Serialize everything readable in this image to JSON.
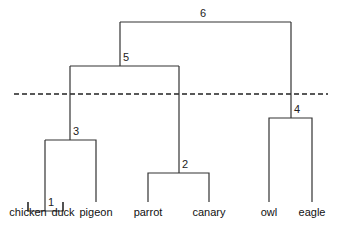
{
  "diagram": {
    "type": "dendrogram",
    "leaves": [
      {
        "label": "chicken",
        "x": 28
      },
      {
        "label": "duck",
        "x": 63
      },
      {
        "label": "pigeon",
        "x": 96
      },
      {
        "label": "parrot",
        "x": 148
      },
      {
        "label": "canary",
        "x": 209
      },
      {
        "label": "owl",
        "x": 269
      },
      {
        "label": "eagle",
        "x": 312
      }
    ],
    "nodes": [
      {
        "id": "1",
        "label": "1",
        "children": [
          "chicken",
          "duck"
        ]
      },
      {
        "id": "2",
        "label": "2",
        "children": [
          "parrot",
          "canary"
        ]
      },
      {
        "id": "3",
        "label": "3",
        "children": [
          "1",
          "pigeon"
        ]
      },
      {
        "id": "4",
        "label": "4",
        "children": [
          "owl",
          "eagle"
        ]
      },
      {
        "id": "5",
        "label": "5",
        "children": [
          "3",
          "2"
        ]
      },
      {
        "id": "6",
        "label": "6",
        "children": [
          "5",
          "4"
        ]
      }
    ],
    "cut_line": "dashed"
  }
}
